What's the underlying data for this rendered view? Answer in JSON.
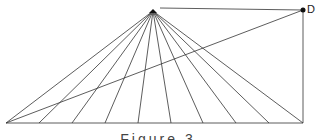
{
  "diagram": {
    "apex": {
      "x": 153,
      "y": 11
    },
    "point_d": {
      "x": 303,
      "y": 10,
      "label": "D"
    },
    "base": {
      "y": 123,
      "x_start": 6,
      "x_end": 303
    },
    "fan_base_points": [
      6,
      39,
      72,
      105,
      138,
      171,
      203,
      236,
      269,
      303
    ],
    "line_color": "#333333"
  },
  "caption": "Figure 3"
}
